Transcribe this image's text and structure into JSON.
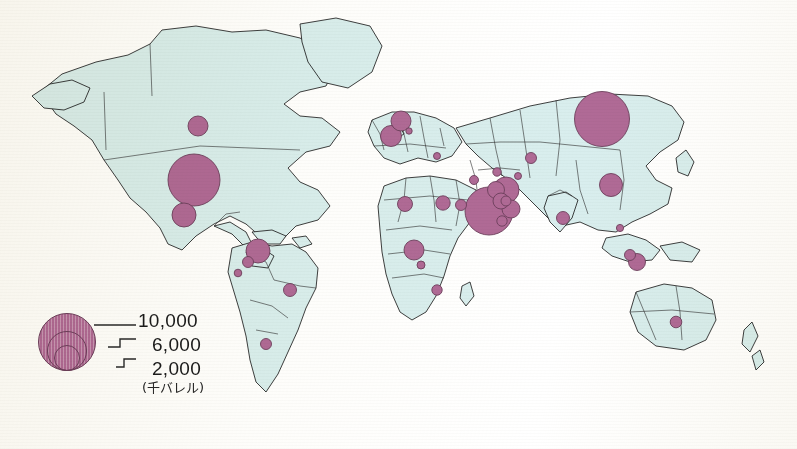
{
  "figure": {
    "caption": "",
    "land_color": "#d9eeee",
    "ocean_color": "#ffffff",
    "symbol_color": "#b06a96",
    "symbol_outline_color": "#6d3f5c",
    "border_color": "#2b2b2b"
  },
  "legend": {
    "name": "proportional-circle-legend",
    "unit": "(千バレル)",
    "entries": [
      {
        "label": "10,000",
        "value": 10000
      },
      {
        "label": "6,000",
        "value": 6000
      },
      {
        "label": "2,000",
        "value": 2000
      }
    ]
  },
  "chart_data": {
    "type": "map",
    "subtype": "proportional-symbol-map",
    "unit": "千バレル",
    "unit_note": "thousand barrels (per day)",
    "projection": "cylindrical (Miller-like)",
    "value_key": "production",
    "legend_breaks": [
      10000,
      6000,
      2000
    ],
    "symbols": [
      {
        "name": "Russia",
        "production": 9500,
        "cx": 602,
        "cy": 119,
        "r": 27.5
      },
      {
        "name": "United States",
        "production": 8800,
        "cx": 194,
        "cy": 180,
        "r": 26.0
      },
      {
        "name": "Saudi Arabia",
        "production": 8600,
        "cx": 489,
        "cy": 211,
        "r": 24.0
      },
      {
        "name": "Iran",
        "production": 3600,
        "cx": 506,
        "cy": 190,
        "r": 13.0
      },
      {
        "name": "Venezuela",
        "production": 3000,
        "cx": 258,
        "cy": 251,
        "r": 12.0
      },
      {
        "name": "Mexico",
        "production": 3000,
        "cx": 184,
        "cy": 215,
        "r": 12.0
      },
      {
        "name": "China",
        "production": 2900,
        "cx": 611,
        "cy": 185,
        "r": 11.5
      },
      {
        "name": "Nigeria",
        "production": 2000,
        "cx": 414,
        "cy": 250,
        "r": 10.0
      },
      {
        "name": "Canada",
        "production": 2000,
        "cx": 198,
        "cy": 126,
        "r": 10.0
      },
      {
        "name": "United Kingdom",
        "production": 2300,
        "cx": 391,
        "cy": 136,
        "r": 10.5
      },
      {
        "name": "Norway",
        "production": 2200,
        "cx": 401,
        "cy": 121,
        "r": 10.0
      },
      {
        "name": "Iraq",
        "production": 2000,
        "cx": 496,
        "cy": 190,
        "r": 8.5
      },
      {
        "name": "Kuwait",
        "production": 1900,
        "cx": 501,
        "cy": 201,
        "r": 8.0
      },
      {
        "name": "United Arab Emirates",
        "production": 2100,
        "cx": 511,
        "cy": 209,
        "r": 9.0
      },
      {
        "name": "Qatar",
        "production": 800,
        "cx": 506,
        "cy": 201,
        "r": 5.0
      },
      {
        "name": "Oman",
        "production": 900,
        "cx": 502,
        "cy": 221,
        "r": 5.2
      },
      {
        "name": "Algeria",
        "production": 1300,
        "cx": 405,
        "cy": 204,
        "r": 7.5
      },
      {
        "name": "Libya",
        "production": 1400,
        "cx": 443,
        "cy": 203,
        "r": 7.2
      },
      {
        "name": "Egypt",
        "production": 900,
        "cx": 461,
        "cy": 205,
        "r": 5.5
      },
      {
        "name": "Indonesia",
        "production": 1500,
        "cx": 637,
        "cy": 262,
        "r": 8.5
      },
      {
        "name": "Malaysia",
        "production": 750,
        "cx": 630,
        "cy": 255,
        "r": 5.5
      },
      {
        "name": "India",
        "production": 750,
        "cx": 563,
        "cy": 218,
        "r": 6.5
      },
      {
        "name": "Brazil",
        "production": 1000,
        "cx": 290,
        "cy": 290,
        "r": 6.5
      },
      {
        "name": "Colombia",
        "production": 700,
        "cx": 248,
        "cy": 262,
        "r": 5.5
      },
      {
        "name": "Ecuador",
        "production": 400,
        "cx": 238,
        "cy": 273,
        "r": 3.8
      },
      {
        "name": "Argentina",
        "production": 800,
        "cx": 266,
        "cy": 344,
        "r": 5.5
      },
      {
        "name": "Australia",
        "production": 700,
        "cx": 676,
        "cy": 322,
        "r": 5.8
      },
      {
        "name": "Kazakhstan",
        "production": 600,
        "cx": 531,
        "cy": 158,
        "r": 5.5
      },
      {
        "name": "Azerbaijan",
        "production": 400,
        "cx": 497,
        "cy": 172,
        "r": 4.2
      },
      {
        "name": "Turkmenistan",
        "production": 300,
        "cx": 518,
        "cy": 176,
        "r": 3.5
      },
      {
        "name": "Romania",
        "production": 300,
        "cx": 437,
        "cy": 156,
        "r": 3.5
      },
      {
        "name": "Angola",
        "production": 750,
        "cx": 437,
        "cy": 290,
        "r": 5.2
      },
      {
        "name": "Gabon",
        "production": 400,
        "cx": 421,
        "cy": 265,
        "r": 4.0
      },
      {
        "name": "Syria",
        "production": 550,
        "cx": 474,
        "cy": 180,
        "r": 4.5
      },
      {
        "name": "Denmark",
        "production": 300,
        "cx": 409,
        "cy": 131,
        "r": 3.2
      },
      {
        "name": "Vietnam",
        "production": 300,
        "cx": 620,
        "cy": 228,
        "r": 3.6
      }
    ]
  }
}
